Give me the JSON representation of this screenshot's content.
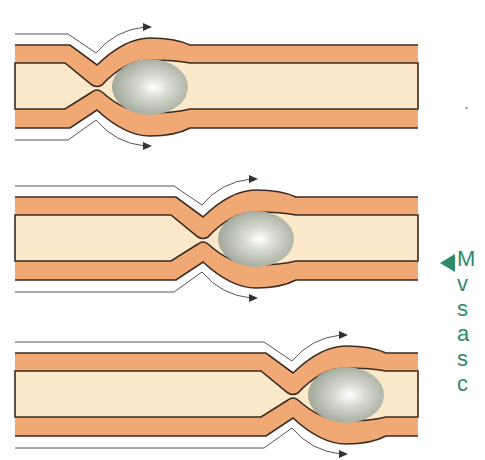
{
  "figure": {
    "colors": {
      "wall": "#f0a874",
      "lumen": "#fbe9c9",
      "outline": "#3a2a20",
      "bolus": "#b8bdb0",
      "flow_arrow": "#444444",
      "caption": "#2e8b6a"
    },
    "panels": [
      {
        "id": 1,
        "pinch_x": 97,
        "bolus_cx": 150,
        "y_top": 45
      },
      {
        "id": 2,
        "pinch_x": 203,
        "bolus_cx": 256,
        "y_top": 197
      },
      {
        "id": 3,
        "pinch_x": 293,
        "bolus_cx": 347,
        "y_top": 353
      }
    ],
    "stray_mark": "•"
  },
  "caption": {
    "pointer": "◀",
    "lines": [
      "M",
      "v",
      "s",
      "a",
      "s",
      "c"
    ]
  }
}
